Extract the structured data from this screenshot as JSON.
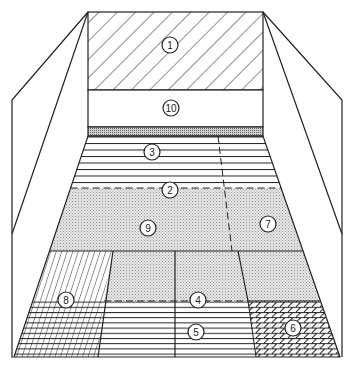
{
  "diagram": {
    "colors": {
      "stroke": "#222222",
      "shade": "#d9d9d9",
      "background": "#ffffff"
    },
    "zones": [
      {
        "id": "1",
        "label": "1",
        "pattern": "diagonal-hatch",
        "area": "front wall upper"
      },
      {
        "id": "10",
        "label": "10",
        "pattern": "blank",
        "area": "front wall lower"
      },
      {
        "id": "3",
        "label": "3",
        "pattern": "horizontal-lines",
        "area": "front court"
      },
      {
        "id": "2",
        "label": "2",
        "pattern": "dashed-line",
        "area": "short line"
      },
      {
        "id": "9",
        "label": "9",
        "pattern": "dotted-shade",
        "area": "mid court left"
      },
      {
        "id": "7",
        "label": "7",
        "pattern": "dotted-shade",
        "area": "mid court right"
      },
      {
        "id": "8",
        "label": "8",
        "pattern": "vertical-hatch + crosshatch",
        "area": "back left corner"
      },
      {
        "id": "4",
        "label": "4",
        "pattern": "dashed-line",
        "area": "back service line"
      },
      {
        "id": "5",
        "label": "5",
        "pattern": "horizontal-lines",
        "area": "back court center"
      },
      {
        "id": "6",
        "label": "6",
        "pattern": "diagonal-crosshatch",
        "area": "back right corner"
      }
    ]
  }
}
